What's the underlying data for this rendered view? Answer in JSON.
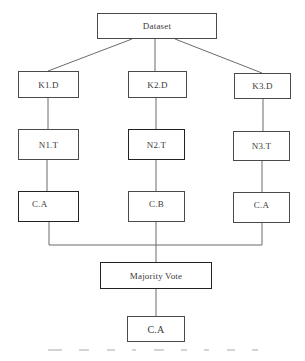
{
  "diagram": {
    "type": "flowchart",
    "nodes": {
      "dataset": "Dataset",
      "k1": "K1.D",
      "k2": "K2.D",
      "k3": "K3.D",
      "n1": "N1.T",
      "n2": "N2.T",
      "n3": "N3.T",
      "c1": "C.A",
      "c2": "C.B",
      "c3": "C.A",
      "vote": "Majority Vote",
      "result": "C.A"
    },
    "edges": [
      [
        "dataset",
        "k1"
      ],
      [
        "dataset",
        "k2"
      ],
      [
        "dataset",
        "k3"
      ],
      [
        "k1",
        "n1"
      ],
      [
        "k2",
        "n2"
      ],
      [
        "k3",
        "n3"
      ],
      [
        "n1",
        "c1"
      ],
      [
        "n2",
        "c2"
      ],
      [
        "n3",
        "c3"
      ],
      [
        "c1",
        "vote"
      ],
      [
        "c2",
        "vote"
      ],
      [
        "c3",
        "vote"
      ],
      [
        "vote",
        "result"
      ]
    ],
    "line_color": "#6b6b6b",
    "border_color": "#4a4a4a"
  }
}
